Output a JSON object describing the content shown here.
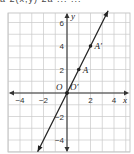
{
  "top_text": "a     2(x,y)     2a          ...     ...",
  "chart_data": {
    "type": "line",
    "title": "",
    "xlabel": "x",
    "ylabel": "y",
    "xlim": [
      -5,
      5.5
    ],
    "ylim": [
      -5,
      7
    ],
    "grid": true,
    "x_ticks": [
      -4,
      -2,
      2,
      4
    ],
    "x_tick_labels": [
      "−4",
      "−2",
      "2",
      "4"
    ],
    "y_ticks": [
      6,
      4,
      2,
      -2,
      -4
    ],
    "y_tick_labels": [
      "6",
      "4",
      "2",
      "−2",
      "−4"
    ],
    "series": [
      {
        "name": "y = 2x",
        "x": [
          -2.5,
          3.5
        ],
        "y": [
          -5,
          7
        ]
      }
    ],
    "points": [
      {
        "label": "O",
        "x": 0,
        "y": 0
      },
      {
        "label": "O′",
        "x": 0,
        "y": 0
      },
      {
        "label": "A",
        "x": 1,
        "y": 2
      },
      {
        "label": "A′",
        "x": 2,
        "y": 4
      }
    ]
  }
}
